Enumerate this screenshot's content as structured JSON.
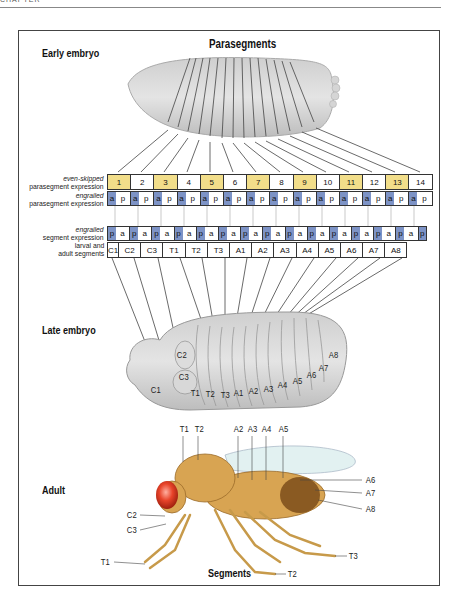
{
  "page_header": "CHAPTER",
  "sections": {
    "early_embryo": "Early embryo",
    "late_embryo": "Late embryo",
    "adult": "Adult"
  },
  "titles": {
    "top": "Parasegments",
    "bottom": "Segments"
  },
  "row_labels": {
    "eve_gene": "even-skipped",
    "eve_desc": "parasegment expression",
    "en_ps_gene": "engrailed",
    "en_ps_desc": "parasegment expression",
    "en_seg_gene": "engrailed",
    "en_seg_desc": "segment expression",
    "seg_line1": "larval and",
    "seg_line2": "adult segments"
  },
  "parasegments": [
    "1",
    "2",
    "3",
    "4",
    "5",
    "6",
    "7",
    "8",
    "9",
    "10",
    "11",
    "12",
    "13",
    "14"
  ],
  "highlight_color": "#f2de8a",
  "engrailed_color": "#7d93c6",
  "engrailed_parasegment_cells": [
    {
      "a": "a",
      "p": "p"
    },
    {
      "a": "a",
      "p": "p"
    },
    {
      "a": "a",
      "p": "p"
    },
    {
      "a": "a",
      "p": "p"
    },
    {
      "a": "a",
      "p": "p"
    },
    {
      "a": "a",
      "p": "p"
    },
    {
      "a": "a",
      "p": "p"
    },
    {
      "a": "a",
      "p": "p"
    },
    {
      "a": "a",
      "p": "p"
    },
    {
      "a": "a",
      "p": "p"
    },
    {
      "a": "a",
      "p": "p"
    },
    {
      "a": "a",
      "p": "p"
    },
    {
      "a": "a",
      "p": "p"
    },
    {
      "a": "a",
      "p": "p"
    }
  ],
  "engrailed_segment_cells": [
    {
      "p": "p",
      "a": "a"
    },
    {
      "p": "p",
      "a": "a"
    },
    {
      "p": "p",
      "a": "a"
    },
    {
      "p": "p",
      "a": "a"
    },
    {
      "p": "p",
      "a": "a"
    },
    {
      "p": "p",
      "a": "a"
    },
    {
      "p": "p",
      "a": "a"
    },
    {
      "p": "p",
      "a": "a"
    },
    {
      "p": "p",
      "a": "a"
    },
    {
      "p": "p",
      "a": "a"
    },
    {
      "p": "p",
      "a": "a"
    },
    {
      "p": "p",
      "a": "a"
    },
    {
      "p": "p",
      "a": "a"
    },
    {
      "p": "p",
      "a": "a"
    },
    {
      "p": "p",
      "a": "a"
    }
  ],
  "segments": [
    "C1",
    "C2",
    "C3",
    "T1",
    "T2",
    "T3",
    "A1",
    "A2",
    "A3",
    "A4",
    "A5",
    "A6",
    "A7",
    "A8"
  ],
  "late_embryo_labels": [
    "C1",
    "C2",
    "C3",
    "T1",
    "T2",
    "T3",
    "A1",
    "A2",
    "A3",
    "A4",
    "A5",
    "A6",
    "A7",
    "A8"
  ],
  "adult_labels": {
    "T1_top": "T1",
    "T2_top": "T2",
    "A2": "A2",
    "A3": "A3",
    "A4": "A4",
    "A5": "A5",
    "A6": "A6",
    "A7": "A7",
    "A8": "A8",
    "C2": "C2",
    "C3": "C3",
    "T1_leg": "T1",
    "T2_leg": "T2",
    "T3_leg": "T3"
  }
}
